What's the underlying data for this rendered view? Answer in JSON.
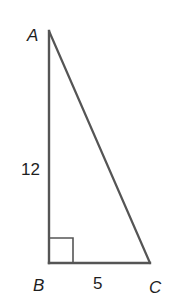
{
  "diagram": {
    "type": "right-triangle",
    "stroke_color": "#555555",
    "text_color": "#1e1e1e",
    "vertices": {
      "A": {
        "label": "A",
        "x": 49,
        "y": 31
      },
      "B": {
        "label": "B",
        "x": 49,
        "y": 263
      },
      "C": {
        "label": "C",
        "x": 150,
        "y": 263
      }
    },
    "sides": {
      "AB": {
        "label": "12"
      },
      "BC": {
        "label": "5"
      }
    },
    "right_angle_at": "B"
  }
}
